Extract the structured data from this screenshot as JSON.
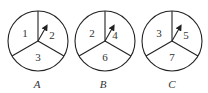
{
  "spinners": [
    {
      "label": "A",
      "sectors": [
        "1",
        "2",
        "3"
      ]
    },
    {
      "label": "B",
      "sectors": [
        "2",
        "4",
        "6"
      ]
    },
    {
      "label": "C",
      "sectors": [
        "3",
        "5",
        "7"
      ]
    }
  ],
  "colors": {
    "stroke": "#222222",
    "text": "#333333",
    "background": "#ffffff"
  }
}
